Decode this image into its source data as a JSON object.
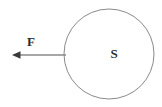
{
  "figure": {
    "width": 162,
    "height": 107,
    "background_color": "#ffffff"
  },
  "shapes": {
    "sphere": {
      "name": "S",
      "label": "S",
      "label_x": 114,
      "label_y": 58,
      "label_font_size": 13,
      "center_x": 109,
      "center_y": 54,
      "radius": 45,
      "stroke_color": "#8a8a8a",
      "stroke_width": 1,
      "fill_color": "none"
    },
    "force_arrow": {
      "name": "F",
      "label": "F",
      "label_x": 31,
      "label_y": 46,
      "label_font_size": 13,
      "direction": "left",
      "tail_x": 66,
      "tail_y": 55,
      "head_x": 13,
      "head_y": 55,
      "stroke_color": "#8a8a8a",
      "stroke_width": 1.4,
      "head_fill_color": "#3a3a3a",
      "head_length": 8,
      "head_half_width": 3.5
    }
  },
  "colors": {
    "line": "#8a8a8a",
    "text": "#2b2b2b",
    "arrowhead": "#3a3a3a",
    "background": "#ffffff"
  }
}
